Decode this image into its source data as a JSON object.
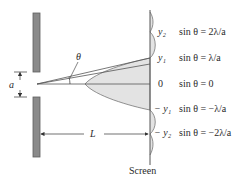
{
  "diagram": {
    "slit_width_label": "a",
    "angle_label": "θ",
    "distance_label": "L",
    "screen_label": "Screen",
    "colors": {
      "barrier": "#8a8a8a",
      "barrier_edge": "#5e5e5e",
      "intensity_fill": "#e3e3e3",
      "line": "#555555",
      "text": "#2a2a2a"
    },
    "positions": [
      {
        "id": "y2",
        "label": "y₂",
        "equation": "sin θ = 2λ/a"
      },
      {
        "id": "y1",
        "label": "y₁",
        "equation": "sin θ = λ/a"
      },
      {
        "id": "zero",
        "label": "0",
        "equation": "sin θ = 0"
      },
      {
        "id": "neg-y1",
        "label": "− y₁",
        "equation": "sin θ = −λ/a"
      },
      {
        "id": "neg-y2",
        "label": "− y₂",
        "equation": "sin θ = −2λ/a"
      }
    ]
  }
}
